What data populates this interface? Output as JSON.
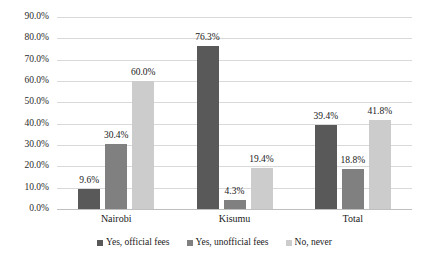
{
  "chart_data": {
    "type": "bar",
    "title": "",
    "subtitle": "",
    "xlabel": "",
    "ylabel": "",
    "categories": [
      "Nairobi",
      "Kisumu",
      "Total"
    ],
    "series": [
      {
        "name": "Yes, official fees",
        "values": [
          9.6,
          76.3,
          39.4
        ],
        "color": "#595959"
      },
      {
        "name": "Yes, unofficial fees",
        "values": [
          30.4,
          4.3,
          18.8
        ],
        "color": "#808080"
      },
      {
        "name": "No, never",
        "values": [
          60.0,
          19.4,
          41.8
        ],
        "color": "#cccccc"
      }
    ],
    "data_labels": [
      [
        "9.6%",
        "30.4%",
        "60.0%"
      ],
      [
        "76.3%",
        "4.3%",
        "19.4%"
      ],
      [
        "39.4%",
        "18.8%",
        "41.8%"
      ]
    ],
    "ylim": [
      0,
      90
    ],
    "ytick_values": [
      0,
      10,
      20,
      30,
      40,
      50,
      60,
      70,
      80,
      90
    ],
    "ytick_labels": [
      "0.0%",
      "10.0%",
      "20.0%",
      "30.0%",
      "40.0%",
      "50.0%",
      "60.0%",
      "70.0%",
      "80.0%",
      "90.0%"
    ],
    "grid": "horizontal",
    "legend_position": "bottom",
    "value_suffix": "%"
  },
  "colors": {
    "gridline": "#d9d9d9",
    "axis": "#bfbfbf",
    "text": "#1a1a1a",
    "background": "#ffffff"
  }
}
